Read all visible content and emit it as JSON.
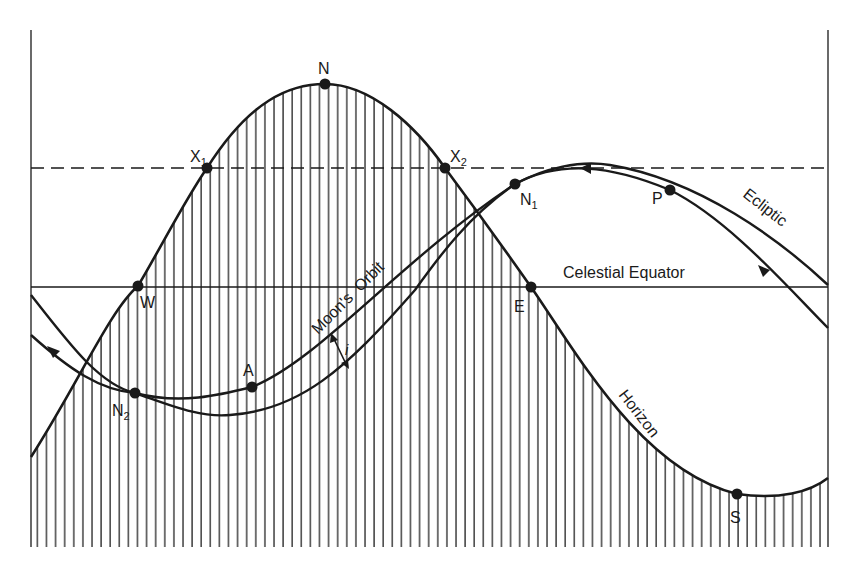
{
  "diagram": {
    "type": "celestial-sphere-projection",
    "colors": {
      "ink": "#1a1a1a",
      "hatch": "#333333",
      "background": "#ffffff"
    },
    "frame": {
      "left": 31,
      "right": 828,
      "top": 30,
      "bottom": 547
    },
    "reference_lines": {
      "celestial_equator": {
        "label": "Celestial Equator",
        "y": 287
      },
      "dashed_line": {
        "y": 168
      }
    },
    "curves": {
      "horizon": {
        "label": "Horizon",
        "note": "below-horizon region hatched with vertical lines"
      },
      "ecliptic": {
        "label": "Ecliptic"
      },
      "moons_orbit": {
        "label": "Moon's  Orbit"
      }
    },
    "inclination_label": "i",
    "points": [
      {
        "id": "N",
        "label": "N",
        "x": 325,
        "y": 84
      },
      {
        "id": "X1",
        "label": "X",
        "sub": "1",
        "x": 207,
        "y": 168
      },
      {
        "id": "X2",
        "label": "X",
        "sub": "2",
        "x": 445,
        "y": 168
      },
      {
        "id": "W",
        "label": "W",
        "x": 138,
        "y": 286
      },
      {
        "id": "E",
        "label": "E",
        "x": 531,
        "y": 287
      },
      {
        "id": "N1",
        "label": "N",
        "sub": "1",
        "x": 515,
        "y": 184
      },
      {
        "id": "N2",
        "label": "N",
        "sub": "2",
        "x": 135,
        "y": 393
      },
      {
        "id": "A",
        "label": "A",
        "x": 252,
        "y": 387
      },
      {
        "id": "P",
        "label": "P",
        "x": 670,
        "y": 190
      },
      {
        "id": "S",
        "label": "S",
        "x": 737,
        "y": 494
      }
    ]
  }
}
